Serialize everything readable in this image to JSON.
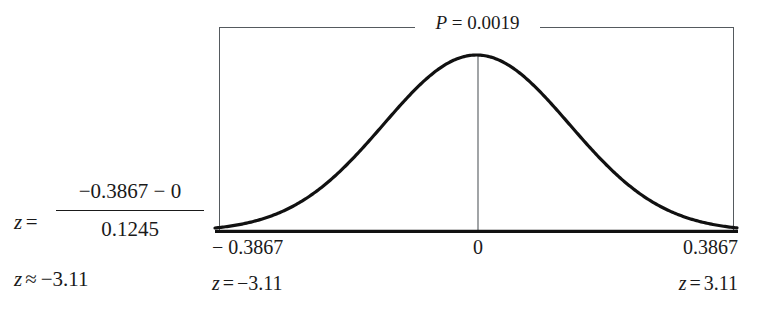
{
  "figure": {
    "formula": {
      "variable": "z",
      "equals": "=",
      "numerator": "−0.3867 − 0",
      "denominator": "0.1245",
      "result_variable": "z",
      "approx_sign": "≈",
      "result_value": "−3.11"
    },
    "chart_label": {
      "p_symbol": "P",
      "p_equals": " = ",
      "p_value": "0.0019"
    },
    "axis": {
      "left": {
        "value": "− 0.3867",
        "z_variable": "z",
        "z_equals": "=",
        "z_value": "−3.11"
      },
      "center": {
        "value": "0"
      },
      "right": {
        "value": "0.3867",
        "z_variable": "z",
        "z_equals": "=",
        "z_value": "3.11"
      }
    }
  },
  "chart_data": {
    "type": "line",
    "title": "P = 0.0019",
    "xlabel": "",
    "ylabel": "",
    "distribution": "normal",
    "mean": 0,
    "sigma_px": 93,
    "peak_x": 0,
    "xlim": [
      -0.3867,
      0.3867
    ],
    "ylim": [
      0,
      1
    ],
    "x_ticks": [
      -0.3867,
      0,
      0.3867
    ],
    "x_tick_labels": [
      "− 0.3867",
      "0",
      "0.3867"
    ],
    "secondary_x_tick_labels": [
      "z = −3.11",
      "",
      "z = 3.11"
    ],
    "annotations": [
      {
        "text": "P = 0.0019",
        "position": "top-center"
      },
      {
        "text": "z = −3.11",
        "position": "bottom-left"
      },
      {
        "text": "z = 3.11",
        "position": "bottom-right"
      }
    ],
    "grid": false,
    "legend": false,
    "curve_color": "#111111",
    "frame_color": "#555a5e",
    "x": [
      -3.11,
      -2.9,
      -2.7,
      -2.5,
      -2.3,
      -2.1,
      -1.9,
      -1.7,
      -1.5,
      -1.3,
      -1.1,
      -0.9,
      -0.7,
      -0.5,
      -0.3,
      -0.1,
      0.1,
      0.3,
      0.5,
      0.7,
      0.9,
      1.1,
      1.3,
      1.5,
      1.7,
      1.9,
      2.1,
      2.3,
      2.5,
      2.7,
      2.9,
      3.11
    ],
    "values": [
      0.007,
      0.014,
      0.027,
      0.047,
      0.077,
      0.115,
      0.164,
      0.222,
      0.287,
      0.356,
      0.425,
      0.492,
      0.552,
      0.604,
      0.644,
      0.672,
      0.672,
      0.644,
      0.604,
      0.552,
      0.492,
      0.425,
      0.356,
      0.287,
      0.222,
      0.164,
      0.115,
      0.077,
      0.047,
      0.027,
      0.014,
      0.007
    ]
  }
}
